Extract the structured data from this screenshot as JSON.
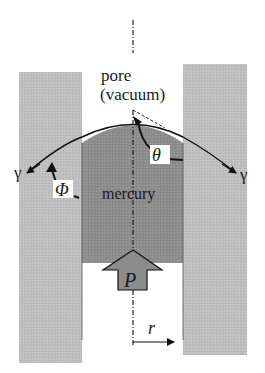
{
  "labels": {
    "pore": "pore",
    "vacuum": "(vacuum)",
    "mercury": "mercury",
    "theta": "θ",
    "phi": "Φ",
    "gamma_left": "γ",
    "gamma_right": "γ",
    "pressure": "P",
    "radius": "r"
  },
  "colors": {
    "wall": "#bdbdbd",
    "mercury": "#8c8c8c",
    "pressure_arrow": "#8c8c8c",
    "line": "#111111",
    "background": "#ffffff"
  }
}
